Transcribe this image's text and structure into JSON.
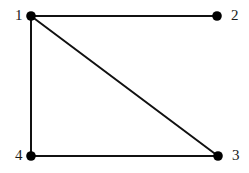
{
  "figure": {
    "type": "undirected-graph-diagram",
    "width": 249,
    "height": 173,
    "background_color": "#ffffff",
    "edge_color": "#111111",
    "node_color": "#000000",
    "label_color": "#1a1a1a",
    "edge_width": 2,
    "node_radius": 4.8
  },
  "chart_data": {
    "type": "diagram",
    "title": "",
    "nodes": [
      {
        "id": "1",
        "label": "1",
        "x": 31,
        "y": 16,
        "label_x": 15,
        "label_y": 8,
        "label_side": "left"
      },
      {
        "id": "2",
        "label": "2",
        "x": 217,
        "y": 16,
        "label_x": 231,
        "label_y": 8,
        "label_side": "right"
      },
      {
        "id": "3",
        "label": "3",
        "x": 218,
        "y": 156,
        "label_x": 232,
        "label_y": 148,
        "label_side": "right"
      },
      {
        "id": "4",
        "label": "4",
        "x": 31,
        "y": 156,
        "label_x": 15,
        "label_y": 148,
        "label_side": "left"
      }
    ],
    "edges": [
      {
        "from": "1",
        "to": "2",
        "name": "edge-1-2"
      },
      {
        "from": "1",
        "to": "4",
        "name": "edge-1-4"
      },
      {
        "from": "4",
        "to": "3",
        "name": "edge-4-3"
      },
      {
        "from": "1",
        "to": "3",
        "name": "edge-1-3"
      }
    ]
  }
}
